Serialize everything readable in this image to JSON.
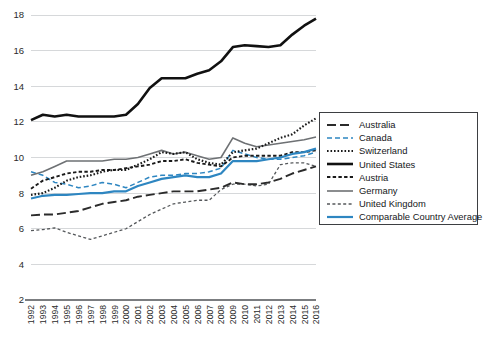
{
  "chart_data": {
    "type": "line",
    "title": "",
    "subtitle": "",
    "xlabel": "",
    "ylabel": "",
    "grid": true,
    "legend_position": "right",
    "ylim": [
      2,
      18
    ],
    "yticks": [
      2,
      4,
      6,
      8,
      10,
      12,
      14,
      16,
      18
    ],
    "x": [
      1992,
      1993,
      1994,
      1995,
      1996,
      1997,
      1998,
      1999,
      2000,
      2001,
      2002,
      2003,
      2004,
      2005,
      2006,
      2007,
      2008,
      2009,
      2010,
      2011,
      2012,
      2013,
      2014,
      2015,
      2016
    ],
    "categories": [
      "1992",
      "1993",
      "1994",
      "1995",
      "1996",
      "1997",
      "1998",
      "1999",
      "2000",
      "2001",
      "2002",
      "2003",
      "2004",
      "2005",
      "2006",
      "2007",
      "2008",
      "2009",
      "2010",
      "2011",
      "2012",
      "2013",
      "2014",
      "2015",
      "2016"
    ],
    "series": [
      {
        "name": "Australia",
        "color": "#2b2b2b",
        "style": "long-dash",
        "dasharray": "9,4",
        "width": 1.9,
        "values": [
          6.75,
          6.8,
          6.8,
          6.9,
          7.0,
          7.2,
          7.4,
          7.5,
          7.6,
          7.8,
          7.9,
          8.0,
          8.1,
          8.1,
          8.1,
          8.2,
          8.3,
          8.6,
          8.5,
          8.5,
          8.6,
          8.8,
          9.1,
          9.3,
          9.5
        ]
      },
      {
        "name": "Canada",
        "color": "#2E86C1",
        "style": "dash",
        "dasharray": "5,3",
        "width": 1.5,
        "values": [
          9.2,
          9.0,
          8.6,
          8.5,
          8.3,
          8.4,
          8.6,
          8.5,
          8.3,
          8.6,
          8.9,
          9.0,
          9.0,
          9.1,
          9.1,
          9.2,
          9.4,
          10.4,
          10.2,
          10.0,
          9.9,
          9.9,
          10.0,
          10.1,
          10.3
        ]
      },
      {
        "name": "Switzerland",
        "color": "#1a1a1a",
        "style": "dotted",
        "dasharray": "1.6,1.9",
        "width": 2.1,
        "values": [
          7.9,
          8.0,
          8.3,
          8.7,
          8.9,
          9.0,
          9.2,
          9.3,
          9.3,
          9.6,
          9.9,
          10.3,
          10.2,
          10.3,
          9.9,
          9.7,
          9.6,
          10.3,
          10.4,
          10.5,
          10.8,
          11.1,
          11.3,
          11.8,
          12.2
        ]
      },
      {
        "name": "United States",
        "color": "#111111",
        "style": "solid",
        "dasharray": "",
        "width": 2.6,
        "values": [
          12.1,
          12.4,
          12.3,
          12.4,
          12.3,
          12.3,
          12.3,
          12.3,
          12.4,
          13.0,
          13.9,
          14.45,
          14.45,
          14.45,
          14.7,
          14.9,
          15.4,
          16.2,
          16.3,
          16.25,
          16.2,
          16.3,
          16.9,
          17.4,
          17.8
        ]
      },
      {
        "name": "Austria",
        "color": "#1a1a1a",
        "style": "short-dash",
        "dasharray": "3.4,2.3",
        "width": 1.9,
        "values": [
          8.25,
          8.7,
          8.9,
          9.1,
          9.2,
          9.2,
          9.3,
          9.3,
          9.4,
          9.5,
          9.6,
          9.8,
          9.8,
          9.9,
          9.7,
          9.6,
          9.5,
          10.0,
          10.1,
          10.1,
          10.1,
          10.1,
          10.3,
          10.3,
          10.4
        ]
      },
      {
        "name": "Germany",
        "color": "#6e7174",
        "style": "solid",
        "dasharray": "",
        "width": 1.6,
        "values": [
          9.0,
          9.2,
          9.5,
          9.8,
          9.8,
          9.8,
          9.8,
          9.9,
          9.9,
          10.0,
          10.2,
          10.4,
          10.2,
          10.3,
          10.1,
          9.9,
          10.0,
          11.1,
          10.8,
          10.6,
          10.7,
          10.8,
          10.9,
          11.0,
          11.15
        ]
      },
      {
        "name": "United Kingdom",
        "color": "#55585b",
        "style": "fine-dash",
        "dasharray": "3,2.4",
        "width": 1.3,
        "values": [
          5.9,
          5.95,
          6.05,
          5.8,
          5.6,
          5.4,
          5.6,
          5.8,
          6.0,
          6.4,
          6.8,
          7.1,
          7.4,
          7.5,
          7.6,
          7.6,
          8.2,
          8.5,
          8.5,
          8.4,
          8.5,
          9.6,
          9.7,
          9.7,
          9.5
        ]
      },
      {
        "name": "Comparable Country Average",
        "color": "#2E86C1",
        "style": "solid",
        "dasharray": "",
        "width": 2.2,
        "values": [
          7.7,
          7.85,
          7.9,
          7.9,
          7.95,
          8.0,
          8.0,
          8.1,
          8.1,
          8.4,
          8.6,
          8.8,
          8.9,
          9.0,
          8.9,
          8.9,
          9.1,
          9.8,
          9.8,
          9.8,
          9.9,
          10.0,
          10.2,
          10.3,
          10.5
        ]
      }
    ]
  },
  "legend": {
    "entries": [
      {
        "label": "Australia"
      },
      {
        "label": "Canada"
      },
      {
        "label": "Switzerland"
      },
      {
        "label": "United States"
      },
      {
        "label": "Austria"
      },
      {
        "label": "Germany"
      },
      {
        "label": "United Kingdom"
      },
      {
        "label": "Comparable Country Average"
      }
    ]
  }
}
